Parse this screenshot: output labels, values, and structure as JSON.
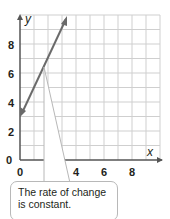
{
  "chart_data": {
    "type": "line",
    "title": "",
    "xlabel": "x",
    "ylabel": "y",
    "xlim": [
      0,
      10
    ],
    "ylim": [
      0,
      10
    ],
    "grid": true,
    "x_ticks": [
      "0",
      "2",
      "4",
      "6",
      "8"
    ],
    "y_ticks": [
      "0",
      "2",
      "4",
      "6",
      "8"
    ],
    "series": [
      {
        "name": "line",
        "x": [
          0,
          3.4
        ],
        "y": [
          3,
          9.8
        ],
        "slope": 2,
        "y_intercept": 3,
        "color": "#666666",
        "arrows": "both"
      }
    ],
    "annotations": [
      {
        "text": "The rate of change is constant.",
        "points_to": [
          [
            2.3,
            6.6
          ]
        ],
        "type": "callout"
      }
    ]
  },
  "callout": {
    "line1": "The rate of change",
    "line2": "is constant."
  },
  "axes": {
    "x_label": "x",
    "y_label": "y",
    "x_tick_labels": [
      "0",
      "2",
      "4",
      "6",
      "8"
    ],
    "y_tick_labels": [
      "0",
      "2",
      "4",
      "6",
      "8"
    ]
  }
}
